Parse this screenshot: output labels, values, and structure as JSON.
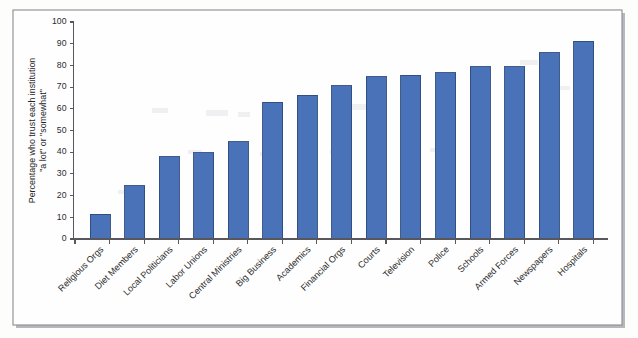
{
  "figure": {
    "frame_border_color": "#8c8c90",
    "background_color": "#fdfdfc",
    "plot_background_color": "#fefefe"
  },
  "chart_data": {
    "type": "bar",
    "title": "",
    "subtitle": "",
    "xlabel": "",
    "ylabel": "Percentage who trust each institution \"a lot\" or \"somewhat\"",
    "ylabel_line1": "Percentage who trust each institution",
    "ylabel_line2": "\"a lot\" or \"somewhat\"",
    "ylim": [
      0,
      100
    ],
    "ytick_step": 10,
    "ytick_labels": [
      "0",
      "10",
      "20",
      "30",
      "40",
      "50",
      "60",
      "70",
      "80",
      "90",
      "100"
    ],
    "ytick_values": [
      0,
      10,
      20,
      30,
      40,
      50,
      60,
      70,
      80,
      90,
      100
    ],
    "grid": false,
    "legend": false,
    "legend_position": "none",
    "bar_fill_color": "#4a72b8",
    "bar_edge_color": "#2c4a7c",
    "categories": [
      "Religious Orgs",
      "Diet Members",
      "Local Politicians",
      "Labor Unions",
      "Central Ministries",
      "Big Business",
      "Academics",
      "Financial Orgs",
      "Courts",
      "Television",
      "Police",
      "Schools",
      "Armed Forces",
      "Newspapers",
      "Hospitals"
    ],
    "values": [
      11.5,
      24.5,
      37.8,
      39.8,
      44.8,
      63.0,
      66.2,
      70.6,
      74.8,
      75.4,
      76.7,
      79.3,
      79.3,
      85.8,
      91.2
    ]
  }
}
